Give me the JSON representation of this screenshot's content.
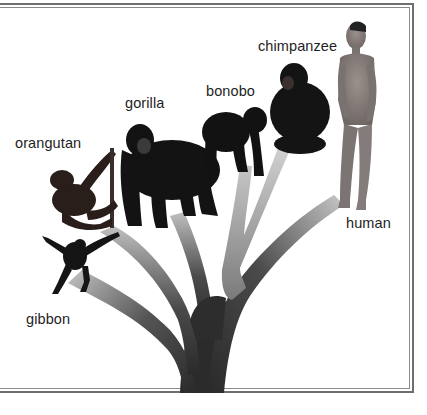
{
  "diagram": {
    "type": "phylogenetic-tree",
    "colors": {
      "frame": "#6e6e6e",
      "branch_dark": "#2e2e2e",
      "branch_light": "#b8b8b8",
      "ape_fur": "#161616",
      "human_skin": "#8a8280",
      "label_text": "#1e1e1e"
    },
    "species": [
      {
        "id": "gibbon",
        "label": "gibbon"
      },
      {
        "id": "orangutan",
        "label": "orangutan"
      },
      {
        "id": "gorilla",
        "label": "gorilla"
      },
      {
        "id": "bonobo",
        "label": "bonobo"
      },
      {
        "id": "chimpanzee",
        "label": "chimpanzee"
      },
      {
        "id": "human",
        "label": "human"
      }
    ]
  }
}
